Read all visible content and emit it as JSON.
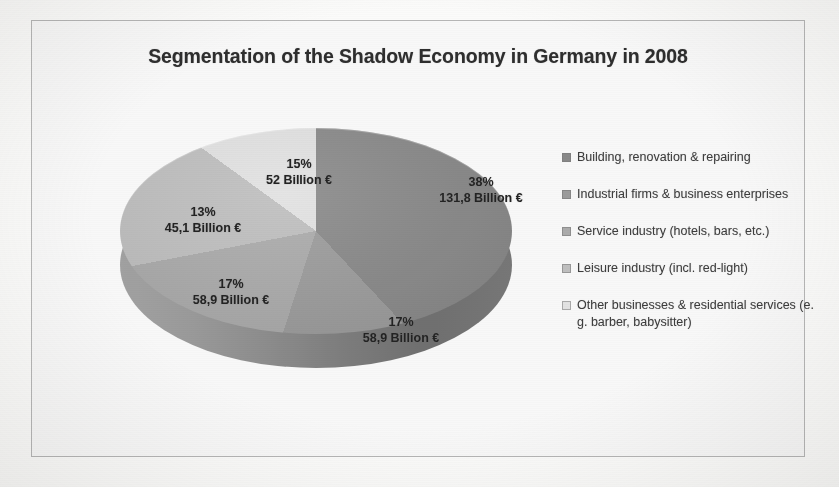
{
  "chart": {
    "title": "Segmentation of the Shadow Economy in Germany in 2008"
  },
  "chart_data": {
    "type": "pie",
    "title": "Segmentation of the Shadow Economy in Germany in 2008",
    "xlabel": "",
    "ylabel": "",
    "unit": "Billion €",
    "legend_position": "right",
    "grid": false,
    "three_d": true,
    "categories": [
      "Building, renovation & repairing",
      "Industrial firms & business enterprises",
      "Service industry (hotels, bars, etc.)",
      "Leisure industry (incl. red-light)",
      "Other businesses & residential services (e. g. barber, babysitter)"
    ],
    "values": [
      131.8,
      58.9,
      58.9,
      45.1,
      52
    ],
    "percentages": [
      38,
      17,
      17,
      13,
      15
    ],
    "colors": [
      "#8a8a88",
      "#9d9d9b",
      "#adadab",
      "#c2c2c0",
      "#e6e6e4"
    ],
    "slices": [
      {
        "label": "Building, renovation & repairing",
        "percent_text": "38%",
        "value_text": "131,8 Billion €",
        "percent": 38,
        "value": 131.8,
        "color": "#8a8a88"
      },
      {
        "label": "Industrial firms & business enterprises",
        "percent_text": "17%",
        "value_text": "58,9 Billion €",
        "percent": 17,
        "value": 58.9,
        "color": "#9d9d9b"
      },
      {
        "label": "Service industry (hotels, bars, etc.)",
        "percent_text": "17%",
        "value_text": "58,9 Billion €",
        "percent": 17,
        "value": 58.9,
        "color": "#adadab"
      },
      {
        "label": "Leisure industry (incl. red-light)",
        "percent_text": "13%",
        "value_text": "45,1 Billion €",
        "percent": 13,
        "value": 45.1,
        "color": "#c2c2c0"
      },
      {
        "label": "Other businesses & residential services (e. g. barber, babysitter)",
        "percent_text": "15%",
        "value_text": "52 Billion €",
        "percent": 15,
        "value": 52,
        "color": "#e6e6e4"
      }
    ]
  },
  "legend": {
    "items": [
      {
        "label": "Building, renovation & repairing",
        "color": "#8a8a88"
      },
      {
        "label": "Industrial firms & business enterprises",
        "color": "#9d9d9b"
      },
      {
        "label": "Service industry (hotels, bars, etc.)",
        "color": "#adadab"
      },
      {
        "label": "Leisure industry (incl. red-light)",
        "color": "#c2c2c0"
      },
      {
        "label": "Other businesses & residential services (e. g. barber, babysitter)",
        "color": "#e6e6e4"
      }
    ]
  }
}
